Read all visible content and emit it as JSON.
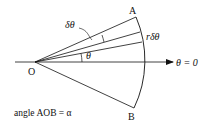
{
  "diagram": {
    "labels": {
      "A": "A",
      "B": "B",
      "O": "O",
      "delta_theta": "δθ",
      "r_delta_theta": "rδθ",
      "theta": "θ",
      "theta_zero": "θ = 0",
      "caption": "angle AOB = α"
    },
    "colors": {
      "stroke": "#111111",
      "background": "#ffffff"
    }
  }
}
